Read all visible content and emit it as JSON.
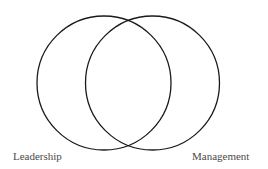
{
  "diagram": {
    "type": "venn",
    "sets": [
      {
        "label": "Leadership",
        "cx": 104,
        "cy": 83,
        "r": 67
      },
      {
        "label": "Management",
        "cx": 152.5,
        "cy": 83,
        "r": 67
      }
    ],
    "stroke_color": "#1a1a1a",
    "label_color": "#4a4a4a"
  }
}
